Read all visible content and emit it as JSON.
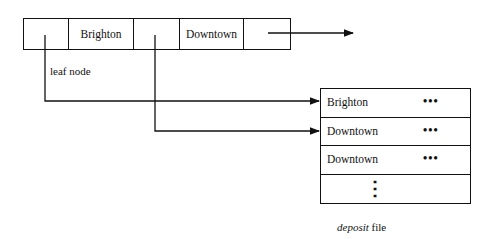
{
  "leaf_node": {
    "label": "leaf node",
    "cells": [
      {
        "type": "pointer",
        "text": ""
      },
      {
        "type": "key",
        "text": "Brighton"
      },
      {
        "type": "pointer",
        "text": ""
      },
      {
        "type": "key",
        "text": "Downtown"
      },
      {
        "type": "pointer",
        "text": ""
      }
    ]
  },
  "deposit_file": {
    "label_italic": "deposit",
    "label_rest": " file",
    "rows": [
      {
        "key": "Brighton",
        "ellipsis": "•••"
      },
      {
        "key": "Downtown",
        "ellipsis": "•••"
      },
      {
        "key": "Downtown",
        "ellipsis": "•••"
      },
      {
        "key": "",
        "ellipsis": "⋮"
      }
    ]
  },
  "colors": {
    "line": "#111111",
    "background": "#ffffff"
  }
}
